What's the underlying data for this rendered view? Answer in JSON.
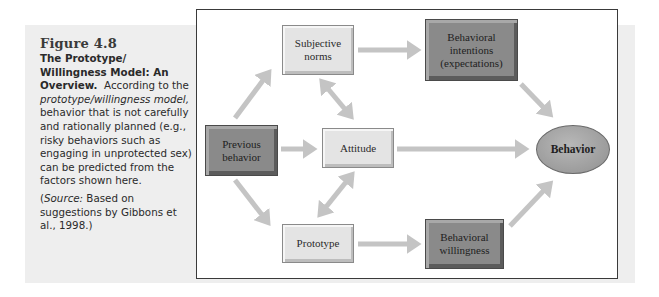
{
  "caption": {
    "figure_number": "Figure 4.8",
    "title": "The Prototype/ Willingness Model: An Overview.",
    "body_intro": "According to the ",
    "body_italic": "prototype/willingness model,",
    "body_rest": " behavior that is not carefully and rationally planned (e.g., risky behaviors such as engaging in unprotected sex) can be predicted from the factors shown here.",
    "source_label": "Source:",
    "source_text": " Based on suggestions by Gibbons et al., 1998.",
    "source_open": "(",
    "source_close": ")"
  },
  "diagram": {
    "nodes": {
      "subjective_norms": "Subjective norms",
      "behavioral_intentions": "Behavioral intentions (expectations)",
      "previous_behavior": "Previous behavior",
      "attitude": "Attitude",
      "behavior": "Behavior",
      "prototype": "Prototype",
      "behavioral_willingness": "Behavioral willingness"
    },
    "edges": [
      {
        "from": "Previous behavior",
        "to": "Subjective norms",
        "type": "directed"
      },
      {
        "from": "Previous behavior",
        "to": "Attitude",
        "type": "directed"
      },
      {
        "from": "Previous behavior",
        "to": "Prototype",
        "type": "directed"
      },
      {
        "from": "Subjective norms",
        "to": "Attitude",
        "type": "bidirectional"
      },
      {
        "from": "Attitude",
        "to": "Prototype",
        "type": "bidirectional"
      },
      {
        "from": "Subjective norms",
        "to": "Behavioral intentions (expectations)",
        "type": "directed"
      },
      {
        "from": "Attitude",
        "to": "Behavior",
        "type": "directed"
      },
      {
        "from": "Prototype",
        "to": "Behavioral willingness",
        "type": "directed"
      },
      {
        "from": "Behavioral intentions (expectations)",
        "to": "Behavior",
        "type": "directed"
      },
      {
        "from": "Behavioral willingness",
        "to": "Behavior",
        "type": "directed"
      }
    ],
    "colors": {
      "arrow": "#c4c4c4",
      "light_box": "#e4e4e4",
      "dark_box": "#8a8a8a",
      "frame_border": "#3a3a3a",
      "background_band": "#eeeeee"
    }
  }
}
